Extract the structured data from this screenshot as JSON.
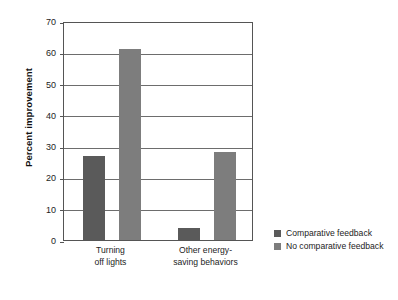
{
  "chart_data": {
    "type": "bar",
    "title": "",
    "xlabel": "",
    "ylabel": "Percent improvement",
    "ylim": [
      0,
      70
    ],
    "ytick_step": 10,
    "yticks": [
      "0",
      "10",
      "20",
      "30",
      "40",
      "50",
      "60",
      "70"
    ],
    "grid": "horizontal",
    "legend_position": "right",
    "categories": [
      "Turning off lights",
      "Other energy-saving behaviors"
    ],
    "category_lines": [
      [
        "Turning",
        "off lights"
      ],
      [
        "Other energy-",
        "saving behaviors"
      ]
    ],
    "series": [
      {
        "name": "Comparative feedback",
        "color": "#5a5a5a",
        "values": [
          27,
          4
        ]
      },
      {
        "name": "No comparative feedback",
        "color": "#7d7d7d",
        "values": [
          61,
          28
        ]
      }
    ]
  },
  "legend": {
    "items": [
      {
        "label": "Comparative feedback",
        "color": "#5a5a5a"
      },
      {
        "label": "No comparative feedback",
        "color": "#7d7d7d"
      }
    ]
  },
  "axis": {
    "y_title": "Percent improvement"
  }
}
